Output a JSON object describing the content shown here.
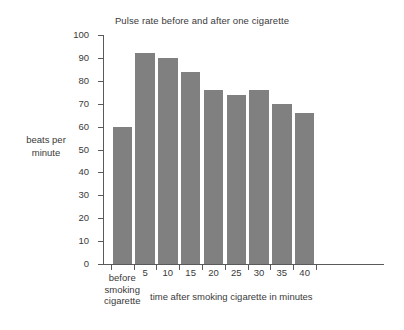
{
  "chart_data": {
    "type": "bar",
    "title": "Pulse rate before and after one cigarette",
    "xlabel": "time after smoking cigarette in minutes",
    "ylabel": "beats per minute",
    "ylabel_lines": [
      "beats per",
      "minute"
    ],
    "categories": [
      "before smoking cigarette",
      "5",
      "10",
      "15",
      "20",
      "25",
      "30",
      "35",
      "40"
    ],
    "category_lines": [
      [
        "before",
        "smoking",
        "cigarette"
      ],
      [
        "5"
      ],
      [
        "10"
      ],
      [
        "15"
      ],
      [
        "20"
      ],
      [
        "25"
      ],
      [
        "30"
      ],
      [
        "35"
      ],
      [
        "40"
      ]
    ],
    "values": [
      60,
      92,
      90,
      84,
      76,
      74,
      76,
      70,
      66
    ],
    "ylim": [
      0,
      100
    ],
    "ytick_values": [
      0,
      10,
      20,
      30,
      40,
      50,
      60,
      70,
      80,
      90,
      100
    ],
    "ytick_labels": [
      "0",
      "10",
      "20",
      "30",
      "40",
      "50",
      "60",
      "70",
      "80",
      "90",
      "100"
    ],
    "grid": false,
    "legend": null,
    "bar_color": "#808080",
    "axis_color": "#5a5a5a",
    "text_color": "#3a3a3a",
    "background_color": "#ffffff"
  }
}
